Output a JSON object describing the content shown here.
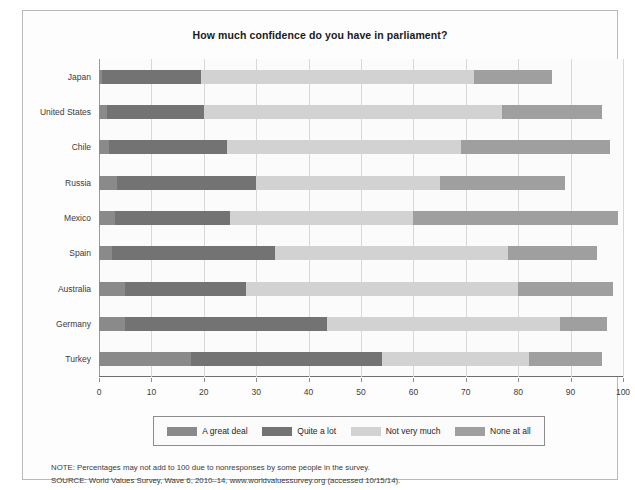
{
  "chart_data": {
    "type": "bar",
    "orientation": "horizontal",
    "stacked": true,
    "title": "How much confidence do you have in parliament?",
    "xlabel": "",
    "ylabel": "",
    "xlim": [
      0,
      100
    ],
    "xticks": [
      0,
      10,
      20,
      30,
      40,
      50,
      60,
      70,
      80,
      90,
      100
    ],
    "xtick_labels": [
      "0",
      "10",
      "20",
      "30",
      "40",
      "50",
      "60",
      "70",
      "80",
      "90",
      "100"
    ],
    "grid": true,
    "legend_position": "bottom",
    "categories": [
      "Japan",
      "United States",
      "Chile",
      "Russia",
      "Mexico",
      "Spain",
      "Australia",
      "Germany",
      "Turkey"
    ],
    "series": [
      {
        "name": "A great deal",
        "color": "#8a8a8a",
        "values": [
          0.5,
          1.5,
          2.0,
          3.5,
          3.0,
          2.5,
          5.0,
          5.0,
          17.5
        ]
      },
      {
        "name": "Quite a lot",
        "color": "#737373",
        "values": [
          19.0,
          18.5,
          22.5,
          26.5,
          22.0,
          31.0,
          23.0,
          38.5,
          36.5
        ]
      },
      {
        "name": "Not very much",
        "color": "#d2d2d2",
        "values": [
          52.0,
          57.0,
          44.5,
          35.0,
          35.0,
          44.5,
          52.0,
          44.5,
          28.0
        ]
      },
      {
        "name": "None at all",
        "color": "#9f9f9f",
        "values": [
          15.0,
          19.0,
          28.5,
          24.0,
          39.0,
          17.0,
          18.0,
          9.0,
          14.0
        ]
      }
    ],
    "totals": [
      86.5,
      96.0,
      97.5,
      89.0,
      99.0,
      95.0,
      98.0,
      97.0,
      96.0
    ],
    "annotations": [
      "NOTE: Percentages may not add to 100 due to nonresponses by some people in the survey.",
      "SOURCE: World Values Survey, Wave 6, 2010–14, www.worldvaluessurvey.org (accessed 10/15/14)."
    ]
  },
  "notes": {
    "line1": "NOTE: Percentages may not add to 100 due to nonresponses by some people in the survey.",
    "line2": "SOURCE: World Values Survey, Wave 6, 2010–14, www.worldvaluessurvey.org (accessed 10/15/14)."
  },
  "colors": {
    "a_great_deal": "#8a8a8a",
    "quite_a_lot": "#737373",
    "not_very_much": "#d2d2d2",
    "none_at_all": "#9f9f9f",
    "grid": "#d8d8d8",
    "frame": "#b9b9b9"
  }
}
